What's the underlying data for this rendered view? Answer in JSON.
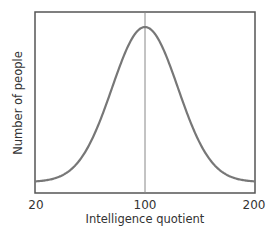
{
  "chart_data": {
    "type": "line",
    "title": "",
    "xlabel": "Intelligence quotient",
    "ylabel": "Number of people",
    "x_ticks": [
      "20",
      "100",
      "200"
    ],
    "xlim": [
      20,
      200
    ],
    "ylim": null,
    "grid": false,
    "legend": null,
    "reference_line": {
      "x": 100,
      "orientation": "vertical"
    },
    "series": [
      {
        "name": "IQ distribution (normal curve)",
        "distribution": "normal",
        "mean": 100,
        "x": [
          20,
          40,
          60,
          80,
          90,
          100,
          110,
          120,
          140,
          160,
          180,
          200
        ],
        "relative_values": [
          0.0,
          0.03,
          0.15,
          0.6,
          0.88,
          1.0,
          0.88,
          0.6,
          0.15,
          0.03,
          0.01,
          0.0
        ]
      }
    ],
    "colors": {
      "curve": "#777777",
      "axes": "#555555",
      "reference_line": "#888888"
    }
  }
}
